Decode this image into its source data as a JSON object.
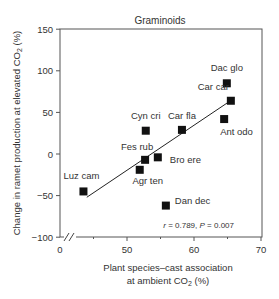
{
  "chart_data": {
    "type": "scatter",
    "title": "Graminoids",
    "xlabel_line1": "Plant species–cast association",
    "xlabel_line2": "at ambient CO",
    "xlabel_sub": "2",
    "xlabel_suffix": " (%)",
    "ylabel": "Change in ramet production at elevated CO",
    "ylabel_sub": "2",
    "ylabel_suffix": " (%)",
    "xlim": [
      0,
      70
    ],
    "ylim": [
      -100,
      150
    ],
    "x_axis_break": true,
    "xticks": [
      {
        "value": 0,
        "label": "0"
      },
      {
        "value": 50,
        "label": "50"
      },
      {
        "value": 60,
        "label": "60"
      },
      {
        "value": 70,
        "label": "70"
      }
    ],
    "yticks": [
      {
        "value": 150,
        "label": "150"
      },
      {
        "value": 100,
        "label": "100"
      },
      {
        "value": 50,
        "label": "50"
      },
      {
        "value": 0,
        "label": "0"
      },
      {
        "value": -50,
        "label": "−50"
      },
      {
        "value": -100,
        "label": "−100"
      }
    ],
    "points": [
      {
        "label": "Luz cam",
        "x": 43.5,
        "y": -45
      },
      {
        "label": "Agr ten",
        "x": 51.9,
        "y": -19
      },
      {
        "label": "Fes rub",
        "x": 52.7,
        "y": -7
      },
      {
        "label": "Bro ere",
        "x": 54.6,
        "y": -4
      },
      {
        "label": "Cyn cri",
        "x": 52.8,
        "y": 28
      },
      {
        "label": "Car fla",
        "x": 58.2,
        "y": 29
      },
      {
        "label": "Dan dec",
        "x": 55.8,
        "y": -62
      },
      {
        "label": "Dac glo",
        "x": 64.9,
        "y": 85
      },
      {
        "label": "Car car",
        "x": 65.5,
        "y": 64
      },
      {
        "label": "Ant odo",
        "x": 64.5,
        "y": 42
      }
    ],
    "regression_line": {
      "x1": 44,
      "y1": -52,
      "x2": 66,
      "y2": 67
    },
    "annotation": {
      "r_label": "r",
      "r_value": " = 0.789, ",
      "p_label": "P",
      "p_value": " = 0.007"
    },
    "grid": false,
    "legend": null
  }
}
